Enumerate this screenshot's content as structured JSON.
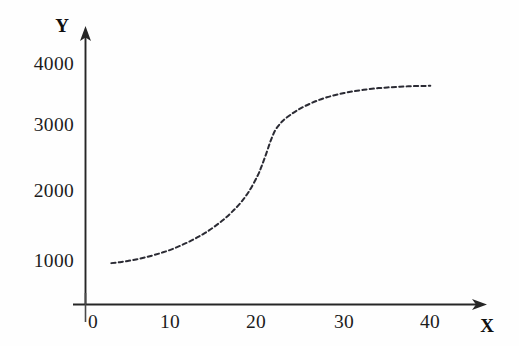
{
  "chart_data": {
    "type": "line",
    "title": "",
    "subtitle": "",
    "xlabel": "X",
    "ylabel": "Y",
    "xlim": [
      0,
      43
    ],
    "ylim": [
      0,
      4300
    ],
    "xticks": [
      "0",
      "10",
      "20",
      "30",
      "40"
    ],
    "xtick_values": [
      0,
      10,
      20,
      30,
      40
    ],
    "yticks": [
      "1000",
      "2000",
      "3000",
      "4000"
    ],
    "ytick_values": [
      1000,
      2000,
      3000,
      4000
    ],
    "grid": false,
    "legend": null,
    "legend_position": "none",
    "line_style": "dashed",
    "line_color": "#2b2b34",
    "axis_color": "#262626",
    "background_color": "#fefefe",
    "annotations": [],
    "series": [
      {
        "name": "curve",
        "x": [
          3.0,
          4.0,
          5.0,
          6.0,
          7.0,
          8.0,
          9.0,
          10.0,
          11.0,
          12.0,
          13.0,
          14.0,
          15.0,
          16.0,
          17.0,
          18.0,
          19.0,
          20.0,
          20.5,
          21.0,
          21.5,
          22.0,
          22.5,
          23.0,
          24.0,
          25.0,
          26.0,
          27.0,
          28.0,
          29.0,
          30.0,
          31.0,
          32.0,
          33.0,
          34.0,
          35.0,
          36.0,
          37.0,
          38.0,
          39.0,
          40.0
        ],
        "y": [
          960,
          975,
          995,
          1020,
          1050,
          1085,
          1125,
          1170,
          1225,
          1285,
          1355,
          1430,
          1520,
          1620,
          1740,
          1880,
          2060,
          2300,
          2460,
          2640,
          2830,
          2980,
          3070,
          3140,
          3240,
          3320,
          3385,
          3440,
          3485,
          3520,
          3550,
          3575,
          3595,
          3612,
          3625,
          3635,
          3643,
          3650,
          3655,
          3658,
          3660
        ]
      }
    ]
  },
  "axes": {
    "y_label": "Y",
    "x_label": "X",
    "origin_label": "0"
  }
}
